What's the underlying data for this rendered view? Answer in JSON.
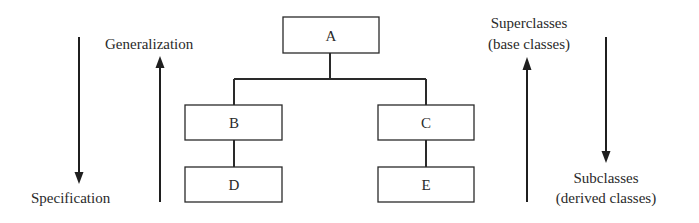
{
  "diagram": {
    "type": "class-hierarchy",
    "nodes": [
      {
        "id": "A",
        "label": "A",
        "level": 0
      },
      {
        "id": "B",
        "label": "B",
        "level": 1,
        "parent": "A"
      },
      {
        "id": "C",
        "label": "C",
        "level": 1,
        "parent": "A"
      },
      {
        "id": "D",
        "label": "D",
        "level": 2,
        "parent": "B"
      },
      {
        "id": "E",
        "label": "E",
        "level": 2,
        "parent": "C"
      }
    ],
    "edges": [
      {
        "from": "A",
        "to": "B"
      },
      {
        "from": "A",
        "to": "C"
      },
      {
        "from": "B",
        "to": "D"
      },
      {
        "from": "C",
        "to": "E"
      }
    ]
  },
  "left_annotations": {
    "specification": {
      "label": "Specification",
      "direction": "down"
    },
    "generalization": {
      "label": "Generalization",
      "direction": "up"
    }
  },
  "right_annotations": {
    "superclasses": {
      "line1": "Superclasses",
      "line2": "(base classes)",
      "direction": "up"
    },
    "subclasses": {
      "line1": "Subclasses",
      "line2": "(derived classes)",
      "direction": "down"
    }
  }
}
